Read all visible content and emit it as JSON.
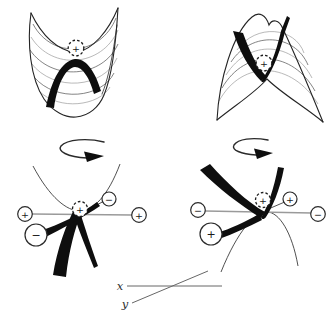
{
  "colors": {
    "paper": "#ffffff",
    "ink": "#0e0e0e",
    "soft_line": "#9a9a9a"
  },
  "top_left_saddle": {
    "particle_sign": "+"
  },
  "top_right_saddle": {
    "particle_sign": "+"
  },
  "left_section": {
    "particle_sign": "+",
    "left_electrode_sign": "+",
    "right_electrode_sign": "+",
    "back_electrode_sign": "−",
    "front_electrode_sign": "−"
  },
  "right_section": {
    "particle_sign": "+",
    "left_electrode_sign": "−",
    "right_electrode_sign": "−",
    "back_electrode_sign": "+",
    "front_electrode_sign": "+"
  },
  "axes": {
    "x_label": "x",
    "y_label": "y"
  }
}
